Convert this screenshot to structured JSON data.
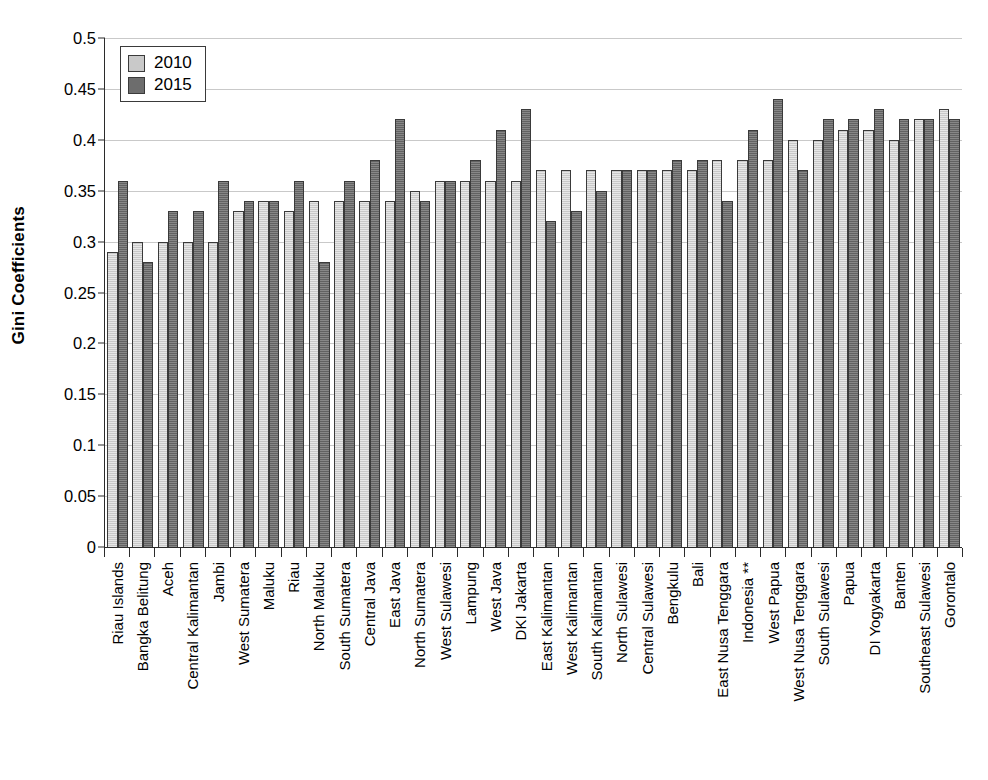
{
  "chart_data": {
    "type": "bar",
    "title": "",
    "xlabel": "",
    "ylabel": "Gini Coefficients",
    "ylim": [
      0,
      0.5
    ],
    "ytick_step": 0.05,
    "ytick_labels": [
      "0.5",
      "0.45",
      "0.4",
      "0.35",
      "0.3",
      "0.25",
      "0.2",
      "0.15",
      "0.1",
      "0.05",
      "0"
    ],
    "ytick_values": [
      0.5,
      0.45,
      0.4,
      0.35,
      0.3,
      0.25,
      0.2,
      0.15,
      0.1,
      0.05,
      0
    ],
    "grid": true,
    "legend_position": "top-left",
    "colors": {
      "2010": "#c9c9c9",
      "2015": "#6d6d6d",
      "axis": "#2b2b2b",
      "grid": "#c9c9c9"
    },
    "categories": [
      "Riau Islands",
      "Bangka Belitung",
      "Aceh",
      "Central Kalimantan",
      "Jambi",
      "West Sumatera",
      "Maluku",
      "Riau",
      "North Maluku",
      "South Sumatera",
      "Central Java",
      "East Java",
      "North Sumatera",
      "West Sulawesi",
      "Lampung",
      "West Java",
      "DKI Jakarta",
      "East Kalimantan",
      "West Kalimantan",
      "South Kalimantan",
      "North Sulawesi",
      "Central Sulawesi",
      "Bengkulu",
      "Bali",
      "East Nusa Tenggara",
      "Indonesia **",
      "West Papua",
      "West Nusa Tenggara",
      "South Sulawesi",
      "Papua",
      "DI Yogyakarta",
      "Banten",
      "Southeast Sulawesi",
      "Gorontalo"
    ],
    "series": [
      {
        "name": "2010",
        "values": [
          0.29,
          0.3,
          0.3,
          0.3,
          0.3,
          0.33,
          0.34,
          0.33,
          0.34,
          0.34,
          0.34,
          0.34,
          0.35,
          0.36,
          0.36,
          0.36,
          0.36,
          0.37,
          0.37,
          0.37,
          0.37,
          0.37,
          0.37,
          0.37,
          0.38,
          0.38,
          0.38,
          0.4,
          0.4,
          0.41,
          0.41,
          0.4,
          0.42,
          0.43
        ]
      },
      {
        "name": "2015",
        "values": [
          0.36,
          0.28,
          0.33,
          0.33,
          0.36,
          0.34,
          0.34,
          0.36,
          0.28,
          0.36,
          0.38,
          0.42,
          0.34,
          0.36,
          0.38,
          0.41,
          0.43,
          0.32,
          0.33,
          0.35,
          0.37,
          0.37,
          0.38,
          0.38,
          0.34,
          0.41,
          0.44,
          0.37,
          0.42,
          0.42,
          0.43,
          0.42,
          0.42,
          0.42
        ]
      }
    ]
  },
  "legend": {
    "entries": [
      {
        "label": "2010",
        "swatch": "2010"
      },
      {
        "label": "2015",
        "swatch": "2015"
      }
    ]
  }
}
